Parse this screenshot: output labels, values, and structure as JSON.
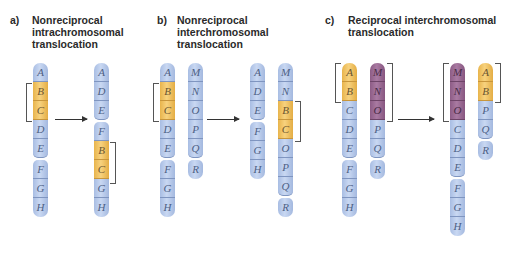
{
  "colors": {
    "blue_band": "#b7c9ea",
    "yellow_band": "#f2c566",
    "purple_band": "#9b6b94",
    "label_text": "#4d5f85",
    "title_text": "#2a2a2a"
  },
  "panels": [
    {
      "letter": "a)",
      "title": "Nonreciprocal\nintrachromosomal\ntranslocation",
      "before": [
        {
          "bands": [
            "A",
            "B",
            "C",
            "D",
            "E",
            "F",
            "G",
            "H"
          ],
          "highlight": [
            "B",
            "C"
          ]
        }
      ],
      "after": [
        {
          "bands": [
            "A",
            "D",
            "E",
            "F",
            "B",
            "C",
            "G",
            "H"
          ],
          "highlight": [
            "B",
            "C"
          ]
        }
      ]
    },
    {
      "letter": "b)",
      "title": "Nonreciprocal\ninterchromosomal\ntranslocation",
      "before": [
        {
          "bands": [
            "A",
            "B",
            "C",
            "D",
            "E",
            "F",
            "G",
            "H"
          ],
          "highlight": [
            "B",
            "C"
          ]
        },
        {
          "bands": [
            "M",
            "N",
            "O",
            "P",
            "Q",
            "R"
          ],
          "highlight": []
        }
      ],
      "after": [
        {
          "bands": [
            "A",
            "D",
            "E",
            "F",
            "G",
            "H"
          ],
          "highlight": []
        },
        {
          "bands": [
            "M",
            "N",
            "B",
            "C",
            "O",
            "P",
            "Q",
            "R"
          ],
          "highlight": [
            "B",
            "C"
          ]
        }
      ]
    },
    {
      "letter": "c)",
      "title": "Reciprocal interchromosomal\ntranslocation",
      "before": [
        {
          "bands": [
            "A",
            "B",
            "C",
            "D",
            "E",
            "F",
            "G",
            "H"
          ],
          "highlight": [
            "A",
            "B"
          ]
        },
        {
          "bands": [
            "M",
            "N",
            "O",
            "P",
            "Q",
            "R"
          ],
          "highlight": [
            "M",
            "N",
            "O"
          ]
        }
      ],
      "after": [
        {
          "bands": [
            "M",
            "N",
            "O",
            "C",
            "D",
            "E",
            "F",
            "G",
            "H"
          ],
          "highlight": [
            "M",
            "N",
            "O"
          ]
        },
        {
          "bands": [
            "A",
            "B",
            "P",
            "Q",
            "R"
          ],
          "highlight": [
            "A",
            "B"
          ]
        }
      ]
    }
  ]
}
